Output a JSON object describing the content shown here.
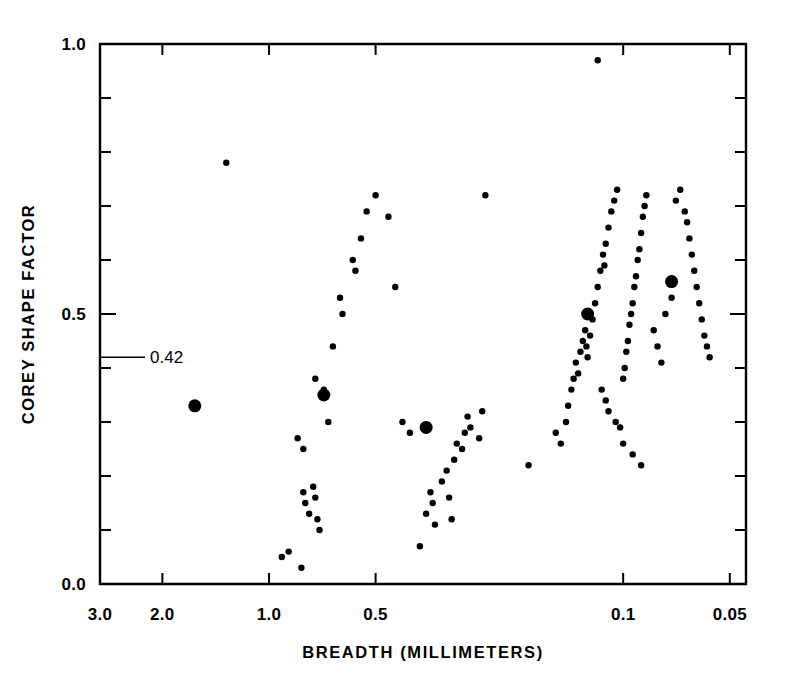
{
  "chart_data": {
    "type": "scatter",
    "title": "",
    "xlabel": "BREADTH (MILLIMETERS)",
    "ylabel": "COREY SHAPE FACTOR",
    "x_scale": "log",
    "x_reversed": true,
    "xlim": [
      3.0,
      0.045
    ],
    "ylim": [
      0.0,
      1.0
    ],
    "grid": false,
    "legend": null,
    "x_tick_labels": [
      "3.0",
      "2.0",
      "1.0",
      "0.5",
      "0.1",
      "0.05"
    ],
    "x_tick_values": [
      3.0,
      2.0,
      1.0,
      0.5,
      0.1,
      0.05
    ],
    "y_tick_labels": [
      "0.0",
      "0.5",
      "1.0"
    ],
    "y_tick_values": [
      0.0,
      0.5,
      1.0
    ],
    "y_minor_ticks": [
      0.1,
      0.2,
      0.3,
      0.4,
      0.6,
      0.7,
      0.8,
      0.9
    ],
    "annotations": [
      {
        "label": "0.42",
        "y_value": 0.42,
        "kind": "y-pointer"
      }
    ],
    "series": [
      {
        "name": "individual samples",
        "marker": "small-filled-circle",
        "marker_radius_px": 3.2,
        "color": "#000000",
        "points": [
          [
            1.32,
            0.78
          ],
          [
            0.92,
            0.05
          ],
          [
            0.88,
            0.06
          ],
          [
            0.81,
            0.03
          ],
          [
            0.8,
            0.17
          ],
          [
            0.79,
            0.15
          ],
          [
            0.77,
            0.13
          ],
          [
            0.75,
            0.18
          ],
          [
            0.74,
            0.16
          ],
          [
            0.73,
            0.12
          ],
          [
            0.72,
            0.1
          ],
          [
            0.83,
            0.27
          ],
          [
            0.8,
            0.25
          ],
          [
            0.74,
            0.38
          ],
          [
            0.7,
            0.36
          ],
          [
            0.68,
            0.3
          ],
          [
            0.66,
            0.44
          ],
          [
            0.63,
            0.53
          ],
          [
            0.62,
            0.5
          ],
          [
            0.58,
            0.6
          ],
          [
            0.57,
            0.58
          ],
          [
            0.55,
            0.64
          ],
          [
            0.53,
            0.69
          ],
          [
            0.5,
            0.72
          ],
          [
            0.46,
            0.68
          ],
          [
            0.44,
            0.55
          ],
          [
            0.42,
            0.3
          ],
          [
            0.4,
            0.28
          ],
          [
            0.375,
            0.07
          ],
          [
            0.36,
            0.13
          ],
          [
            0.35,
            0.17
          ],
          [
            0.345,
            0.15
          ],
          [
            0.34,
            0.11
          ],
          [
            0.325,
            0.19
          ],
          [
            0.315,
            0.21
          ],
          [
            0.31,
            0.16
          ],
          [
            0.305,
            0.12
          ],
          [
            0.3,
            0.23
          ],
          [
            0.295,
            0.26
          ],
          [
            0.285,
            0.25
          ],
          [
            0.28,
            0.28
          ],
          [
            0.275,
            0.31
          ],
          [
            0.27,
            0.29
          ],
          [
            0.255,
            0.27
          ],
          [
            0.25,
            0.32
          ],
          [
            0.245,
            0.72
          ],
          [
            0.185,
            0.22
          ],
          [
            0.155,
            0.28
          ],
          [
            0.15,
            0.26
          ],
          [
            0.145,
            0.3
          ],
          [
            0.143,
            0.33
          ],
          [
            0.14,
            0.36
          ],
          [
            0.138,
            0.38
          ],
          [
            0.136,
            0.41
          ],
          [
            0.134,
            0.39
          ],
          [
            0.132,
            0.43
          ],
          [
            0.13,
            0.45
          ],
          [
            0.128,
            0.47
          ],
          [
            0.127,
            0.44
          ],
          [
            0.126,
            0.42
          ],
          [
            0.124,
            0.46
          ],
          [
            0.122,
            0.49
          ],
          [
            0.12,
            0.52
          ],
          [
            0.118,
            0.55
          ],
          [
            0.116,
            0.58
          ],
          [
            0.114,
            0.61
          ],
          [
            0.113,
            0.59
          ],
          [
            0.112,
            0.63
          ],
          [
            0.11,
            0.66
          ],
          [
            0.108,
            0.69
          ],
          [
            0.106,
            0.71
          ],
          [
            0.104,
            0.73
          ],
          [
            0.118,
            0.97
          ],
          [
            0.115,
            0.36
          ],
          [
            0.112,
            0.34
          ],
          [
            0.11,
            0.32
          ],
          [
            0.105,
            0.3
          ],
          [
            0.102,
            0.29
          ],
          [
            0.1,
            0.38
          ],
          [
            0.099,
            0.4
          ],
          [
            0.098,
            0.43
          ],
          [
            0.097,
            0.45
          ],
          [
            0.096,
            0.48
          ],
          [
            0.095,
            0.5
          ],
          [
            0.094,
            0.52
          ],
          [
            0.093,
            0.55
          ],
          [
            0.092,
            0.57
          ],
          [
            0.091,
            0.6
          ],
          [
            0.09,
            0.62
          ],
          [
            0.089,
            0.65
          ],
          [
            0.088,
            0.68
          ],
          [
            0.087,
            0.7
          ],
          [
            0.086,
            0.72
          ],
          [
            0.1,
            0.26
          ],
          [
            0.094,
            0.24
          ],
          [
            0.089,
            0.22
          ],
          [
            0.082,
            0.47
          ],
          [
            0.08,
            0.44
          ],
          [
            0.078,
            0.41
          ],
          [
            0.076,
            0.5
          ],
          [
            0.073,
            0.53
          ],
          [
            0.071,
            0.71
          ],
          [
            0.069,
            0.73
          ],
          [
            0.067,
            0.69
          ],
          [
            0.066,
            0.67
          ],
          [
            0.065,
            0.64
          ],
          [
            0.064,
            0.61
          ],
          [
            0.063,
            0.58
          ],
          [
            0.062,
            0.55
          ],
          [
            0.061,
            0.52
          ],
          [
            0.06,
            0.49
          ],
          [
            0.059,
            0.46
          ],
          [
            0.058,
            0.44
          ],
          [
            0.057,
            0.42
          ]
        ]
      },
      {
        "name": "group means",
        "marker": "large-filled-circle",
        "marker_radius_px": 6.5,
        "color": "#000000",
        "points": [
          [
            1.62,
            0.33
          ],
          [
            0.7,
            0.35
          ],
          [
            0.36,
            0.29
          ],
          [
            0.126,
            0.5
          ],
          [
            0.073,
            0.56
          ]
        ]
      }
    ]
  },
  "geometry": {
    "plot_left_px": 100,
    "plot_right_px": 746,
    "plot_top_px": 44,
    "plot_bottom_px": 584
  }
}
